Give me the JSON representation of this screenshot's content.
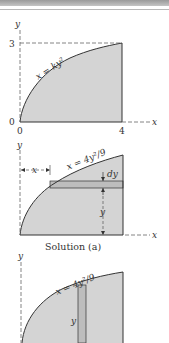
{
  "figure": {
    "panel1": {
      "y_axis_label": "y",
      "x_axis_label": "x",
      "y_tick_top": "3",
      "y_tick_origin": "0",
      "x_tick_origin": "0",
      "x_tick_right": "4",
      "curve_equation": "x = ky²"
    },
    "panel2": {
      "y_axis_label": "y",
      "x_axis_label": "x",
      "curve_equation": "x = 4y²/9",
      "x_dimension_label": "x",
      "dy_label": "dy",
      "y_dimension_label": "y",
      "caption": "Solution (a)"
    },
    "panel3": {
      "y_axis_label": "y",
      "curve_equation": "x = 4y²/9",
      "y_dimension_label": "y"
    },
    "colors": {
      "fill": "#d4d4d4",
      "strip_fill": "#bdbdbd",
      "line": "#333333",
      "dashed": "#666666"
    }
  }
}
